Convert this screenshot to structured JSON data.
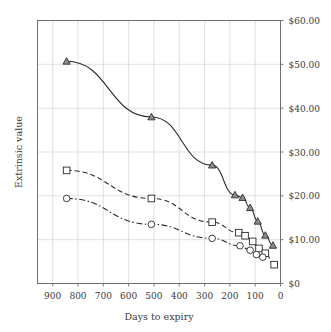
{
  "chart_data": {
    "type": "line",
    "title": "",
    "xlabel": "Days to expiry",
    "ylabel": "Extrinsic value",
    "xlim": [
      960,
      0
    ],
    "ylim": [
      0,
      60
    ],
    "x_reversed": true,
    "grid": true,
    "legend": "none",
    "x_ticks": [
      900,
      800,
      700,
      600,
      500,
      400,
      300,
      200,
      100,
      0
    ],
    "x_ticklabels": [
      "900",
      "800",
      "700",
      "600",
      "500",
      "400",
      "300",
      "200",
      "100",
      "0"
    ],
    "y_ticks": [
      60,
      50,
      40,
      30,
      20,
      10,
      0
    ],
    "y_ticklabels": [
      "$60.00",
      "$50.00",
      "$40.00",
      "$30.00",
      "$20.00",
      "$10.00",
      "$0"
    ],
    "y_axis_position": "right",
    "series": [
      {
        "name": "deep-in-the-money",
        "marker": "triangle",
        "linestyle": "solid",
        "color": "#2b2b2b",
        "x": [
          845,
          510,
          270,
          180,
          150,
          120,
          90,
          60,
          30
        ],
        "y": [
          50.7,
          38.0,
          27.0,
          20.2,
          19.6,
          17.3,
          14.2,
          11.0,
          8.7
        ]
      },
      {
        "name": "at-the-money",
        "marker": "square",
        "linestyle": "dashed",
        "color": "#2b2b2b",
        "x": [
          845,
          510,
          270,
          165,
          140,
          110,
          85,
          60,
          25
        ],
        "y": [
          25.8,
          19.4,
          14.0,
          11.6,
          10.9,
          9.6,
          8.0,
          6.9,
          4.3
        ]
      },
      {
        "name": "out-of-the-money",
        "marker": "circle",
        "linestyle": "dashdot",
        "color": "#2b2b2b",
        "x": [
          845,
          510,
          270,
          160,
          120,
          95,
          70
        ],
        "y": [
          19.4,
          13.5,
          10.3,
          8.6,
          7.6,
          6.6,
          6.0
        ]
      }
    ]
  },
  "axes": {
    "xlabel": "Days to expiry",
    "ylabel": "Extrinsic value"
  }
}
